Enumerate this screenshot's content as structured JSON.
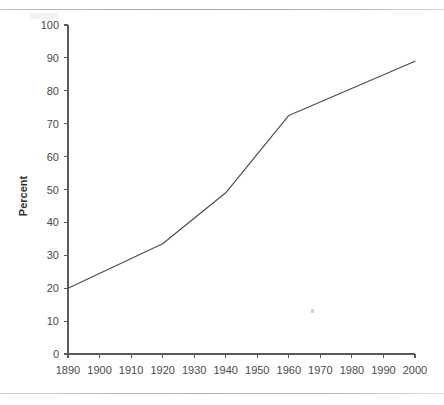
{
  "chart_data": {
    "type": "line",
    "title": "",
    "subtitle": "",
    "xlabel": "",
    "ylabel": "Percent",
    "x": [
      1890,
      1920,
      1940,
      1960,
      2000
    ],
    "values": [
      20,
      33.5,
      49,
      72.5,
      89
    ],
    "series": [
      {
        "name": "Percent",
        "x": [
          1890,
          1920,
          1940,
          1960,
          2000
        ],
        "values": [
          20,
          33.5,
          49,
          72.5,
          89
        ]
      }
    ],
    "xlim": [
      1890,
      2000
    ],
    "ylim": [
      0,
      100
    ],
    "xticks": [
      1890,
      1900,
      1910,
      1920,
      1930,
      1940,
      1950,
      1960,
      1970,
      1980,
      1990,
      2000
    ],
    "yticks": [
      0,
      10,
      20,
      30,
      40,
      50,
      60,
      70,
      80,
      90,
      100
    ],
    "xtick_labels": [
      "1890",
      "1900",
      "1910",
      "1920",
      "1930",
      "1940",
      "1950",
      "1960",
      "1970",
      "1980",
      "1990",
      "2000"
    ],
    "ytick_labels": [
      "0",
      "10",
      "20",
      "30",
      "40",
      "50",
      "60",
      "70",
      "80",
      "90",
      "100"
    ],
    "grid": false,
    "legend": false,
    "legend_position": "none",
    "line_color": "#4c4c4c",
    "markers": false
  },
  "figure": {
    "background_color": "#ffffff",
    "axis_color": "#5a5a5a",
    "text_color": "#4a4a4a"
  },
  "artifacts": {
    "scan_line_top": "scan-line",
    "scan_line_bottom": "scan-line",
    "speck": "ink-speck"
  }
}
